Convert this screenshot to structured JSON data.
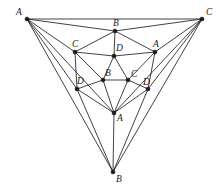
{
  "figure": {
    "name": "nested-triangle-graph",
    "width": 223,
    "height": 192,
    "background_color": "#ffffff",
    "stroke_color": "#231f20",
    "vertex_color": "#1a1a1a"
  },
  "vertices": [
    {
      "id": "outer-A",
      "label": "A",
      "x": 27,
      "y": 19,
      "r": 2.1,
      "label_dx": -11,
      "label_dy": -11
    },
    {
      "id": "outer-C",
      "label": "C",
      "x": 202,
      "y": 19,
      "r": 2.1,
      "label_dx": 4,
      "label_dy": -11
    },
    {
      "id": "outer-B",
      "label": "B",
      "x": 113,
      "y": 172,
      "r": 2.1,
      "label_dx": 3,
      "label_dy": 3
    },
    {
      "id": "mid-B",
      "label": "B",
      "x": 115,
      "y": 31,
      "r": 2.1,
      "label_dx": -2,
      "label_dy": -12
    },
    {
      "id": "mid-C",
      "label": "C",
      "x": 75,
      "y": 52,
      "r": 2.1,
      "label_dx": -3,
      "label_dy": -12
    },
    {
      "id": "mid-A",
      "label": "A",
      "x": 155,
      "y": 52,
      "r": 2.1,
      "label_dx": -2,
      "label_dy": -12
    },
    {
      "id": "mid-D",
      "label": "D",
      "x": 114,
      "y": 56,
      "r": 2.1,
      "label_dx": 2,
      "label_dy": -12
    },
    {
      "id": "core-B",
      "label": "B",
      "x": 103,
      "y": 80,
      "r": 2.1,
      "label_dx": 2,
      "label_dy": -11
    },
    {
      "id": "core-C",
      "label": "C",
      "x": 128,
      "y": 80,
      "r": 2.1,
      "label_dx": 3,
      "label_dy": -10
    },
    {
      "id": "core-Dl",
      "label": "D",
      "x": 77,
      "y": 89,
      "r": 2.1,
      "label_dx": 0,
      "label_dy": -12
    },
    {
      "id": "core-Dr",
      "label": "D",
      "x": 148,
      "y": 89,
      "r": 2.1,
      "label_dx": -5,
      "label_dy": -11
    },
    {
      "id": "core-A",
      "label": "A",
      "x": 114,
      "y": 113,
      "r": 2.1,
      "label_dx": 3,
      "label_dy": 1
    }
  ],
  "edges": [
    {
      "from": "outer-A",
      "to": "outer-C"
    },
    {
      "from": "outer-A",
      "to": "mid-B"
    },
    {
      "from": "outer-C",
      "to": "mid-B"
    },
    {
      "from": "outer-A",
      "to": "mid-C"
    },
    {
      "from": "outer-C",
      "to": "mid-A"
    },
    {
      "from": "outer-A",
      "to": "core-Dl"
    },
    {
      "from": "outer-C",
      "to": "core-Dr"
    },
    {
      "from": "outer-A",
      "to": "outer-B"
    },
    {
      "from": "outer-C",
      "to": "outer-B"
    },
    {
      "from": "outer-A",
      "to": "core-A"
    },
    {
      "from": "outer-C",
      "to": "core-A"
    },
    {
      "from": "mid-C",
      "to": "mid-B"
    },
    {
      "from": "mid-A",
      "to": "mid-B"
    },
    {
      "from": "mid-C",
      "to": "mid-D"
    },
    {
      "from": "mid-A",
      "to": "mid-D"
    },
    {
      "from": "mid-B",
      "to": "mid-D"
    },
    {
      "from": "mid-C",
      "to": "core-Dl"
    },
    {
      "from": "mid-A",
      "to": "core-Dr"
    },
    {
      "from": "mid-C",
      "to": "core-B"
    },
    {
      "from": "mid-A",
      "to": "core-C"
    },
    {
      "from": "mid-D",
      "to": "core-B"
    },
    {
      "from": "mid-D",
      "to": "core-C"
    },
    {
      "from": "core-B",
      "to": "core-C"
    },
    {
      "from": "core-B",
      "to": "core-Dl"
    },
    {
      "from": "core-C",
      "to": "core-Dr"
    },
    {
      "from": "core-B",
      "to": "core-A"
    },
    {
      "from": "core-C",
      "to": "core-A"
    },
    {
      "from": "core-Dl",
      "to": "core-A"
    },
    {
      "from": "core-Dr",
      "to": "core-A"
    },
    {
      "from": "core-Dl",
      "to": "outer-B"
    },
    {
      "from": "core-Dr",
      "to": "outer-B"
    },
    {
      "from": "core-A",
      "to": "outer-B"
    }
  ]
}
